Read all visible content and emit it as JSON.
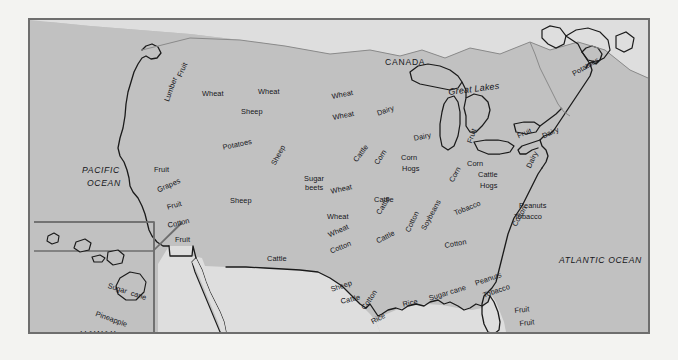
{
  "map": {
    "title": "United States Agricultural Products Map",
    "colors": {
      "page_background": "#f3f3f1",
      "land_gray": "#c1c1c1",
      "neighbor_gray": "#dedede",
      "coastline": "#1a1a1a",
      "frame_border": "#6e6e6e",
      "label_text": "#15161a"
    },
    "countries": [
      {
        "name": "CANADA",
        "x": 355,
        "y": 38
      },
      {
        "name": "MEXICO",
        "x": 253,
        "y": 315
      }
    ],
    "oceans": [
      {
        "name": "PACIFIC",
        "x": 52,
        "y": 146
      },
      {
        "name": "OCEAN",
        "x": 57,
        "y": 159
      },
      {
        "name": "ATLANTIC OCEAN",
        "x": 529,
        "y": 236
      },
      {
        "name": "GULF OF MEXICO",
        "x": 398,
        "y": 311
      }
    ],
    "features": [
      {
        "name": "Great Lakes",
        "x": 418,
        "y": 68,
        "rotate": -7
      }
    ],
    "inset": {
      "name": "HAWAII",
      "label_x": 50,
      "label_y": 310,
      "box": {
        "x": 33,
        "y": 249,
        "w": 120,
        "h": 84
      },
      "crop_labels": [
        {
          "text": "Sugar  cane",
          "x": 79,
          "y": 262,
          "rotate": 18
        },
        {
          "text": "Pineapple",
          "x": 67,
          "y": 290,
          "rotate": 20
        },
        {
          "text": "Sugar  cane",
          "x": 96,
          "y": 326,
          "rotate": 0
        }
      ]
    },
    "product_labels": [
      {
        "text": "Fruit",
        "x": 146,
        "y": 55,
        "rotate": -66
      },
      {
        "text": "Wheat",
        "x": 172,
        "y": 70,
        "rotate": 0
      },
      {
        "text": "Wheat",
        "x": 228,
        "y": 68,
        "rotate": 0
      },
      {
        "text": "Sheep",
        "x": 211,
        "y": 88,
        "rotate": 0
      },
      {
        "text": "Wheat",
        "x": 301,
        "y": 73,
        "rotate": -11
      },
      {
        "text": "Wheat",
        "x": 302,
        "y": 94,
        "rotate": -11
      },
      {
        "text": "Lumber",
        "x": 133,
        "y": 80,
        "rotate": -70
      },
      {
        "text": "Potatoes",
        "x": 192,
        "y": 124,
        "rotate": -12
      },
      {
        "text": "Dairy",
        "x": 346,
        "y": 90,
        "rotate": -19
      },
      {
        "text": "Fruit",
        "x": 124,
        "y": 146,
        "rotate": 0
      },
      {
        "text": "Grapes",
        "x": 126,
        "y": 167,
        "rotate": -24
      },
      {
        "text": "Fruit",
        "x": 136,
        "y": 184,
        "rotate": -16
      },
      {
        "text": "Cotton",
        "x": 137,
        "y": 202,
        "rotate": -13
      },
      {
        "text": "Fruit",
        "x": 145,
        "y": 216,
        "rotate": 0
      },
      {
        "text": "Sheep",
        "x": 240,
        "y": 143,
        "rotate": -62
      },
      {
        "text": "Sheep",
        "x": 200,
        "y": 177,
        "rotate": 0
      },
      {
        "text": "Sugar",
        "x": 274,
        "y": 155,
        "rotate": 0
      },
      {
        "text": "beets",
        "x": 275,
        "y": 164,
        "rotate": 0
      },
      {
        "text": "Cattle",
        "x": 322,
        "y": 139,
        "rotate": -53
      },
      {
        "text": "Corn",
        "x": 343,
        "y": 142,
        "rotate": -57
      },
      {
        "text": "Dairy",
        "x": 383,
        "y": 115,
        "rotate": -12
      },
      {
        "text": "Corn",
        "x": 371,
        "y": 134,
        "rotate": 0
      },
      {
        "text": "Hogs",
        "x": 372,
        "y": 145,
        "rotate": 0
      },
      {
        "text": "Wheat",
        "x": 300,
        "y": 168,
        "rotate": -13
      },
      {
        "text": "Cattle",
        "x": 344,
        "y": 176,
        "rotate": 0
      },
      {
        "text": "Wheat",
        "x": 297,
        "y": 193,
        "rotate": 0
      },
      {
        "text": "Corn",
        "x": 418,
        "y": 160,
        "rotate": -62
      },
      {
        "text": "Corn",
        "x": 437,
        "y": 140,
        "rotate": 0
      },
      {
        "text": "Fruit",
        "x": 436,
        "y": 122,
        "rotate": -72
      },
      {
        "text": "Cattle",
        "x": 448,
        "y": 151,
        "rotate": 0
      },
      {
        "text": "Hogs",
        "x": 450,
        "y": 162,
        "rotate": 0
      },
      {
        "text": "Fruit",
        "x": 486,
        "y": 113,
        "rotate": -24
      },
      {
        "text": "Dairy",
        "x": 511,
        "y": 113,
        "rotate": -24
      },
      {
        "text": "Potatoes",
        "x": 541,
        "y": 51,
        "rotate": -30
      },
      {
        "text": "Dairy",
        "x": 495,
        "y": 146,
        "rotate": -64
      },
      {
        "text": "Tobacco",
        "x": 423,
        "y": 190,
        "rotate": -22
      },
      {
        "text": "Peanuts",
        "x": 489,
        "y": 182,
        "rotate": 0
      },
      {
        "text": "Tobacco",
        "x": 484,
        "y": 193,
        "rotate": 0
      },
      {
        "text": "Cotton",
        "x": 374,
        "y": 210,
        "rotate": -64
      },
      {
        "text": "Soybeans",
        "x": 390,
        "y": 208,
        "rotate": -62
      },
      {
        "text": "Cotton",
        "x": 414,
        "y": 222,
        "rotate": -10
      },
      {
        "text": "Cotton",
        "x": 481,
        "y": 204,
        "rotate": -61
      },
      {
        "text": "Cattle",
        "x": 345,
        "y": 192,
        "rotate": -58
      },
      {
        "text": "Cattle",
        "x": 237,
        "y": 235,
        "rotate": 0
      },
      {
        "text": "Wheat",
        "x": 297,
        "y": 212,
        "rotate": -25
      },
      {
        "text": "Cotton",
        "x": 299,
        "y": 228,
        "rotate": -22
      },
      {
        "text": "Cattle",
        "x": 345,
        "y": 218,
        "rotate": -26
      },
      {
        "text": "Sheep",
        "x": 300,
        "y": 266,
        "rotate": -18
      },
      {
        "text": "Cattle",
        "x": 310,
        "y": 278,
        "rotate": -13
      },
      {
        "text": "Cotton",
        "x": 330,
        "y": 287,
        "rotate": -56
      },
      {
        "text": "Rice",
        "x": 340,
        "y": 299,
        "rotate": -28
      },
      {
        "text": "Rice",
        "x": 372,
        "y": 281,
        "rotate": -13
      },
      {
        "text": "Sugar cane",
        "x": 398,
        "y": 275,
        "rotate": -17
      },
      {
        "text": "Peanuts",
        "x": 444,
        "y": 260,
        "rotate": -19
      },
      {
        "text": "Tobacco",
        "x": 452,
        "y": 272,
        "rotate": -19
      },
      {
        "text": "Fruit",
        "x": 484,
        "y": 287,
        "rotate": -6
      },
      {
        "text": "Fruit",
        "x": 489,
        "y": 300,
        "rotate": -6
      }
    ]
  }
}
